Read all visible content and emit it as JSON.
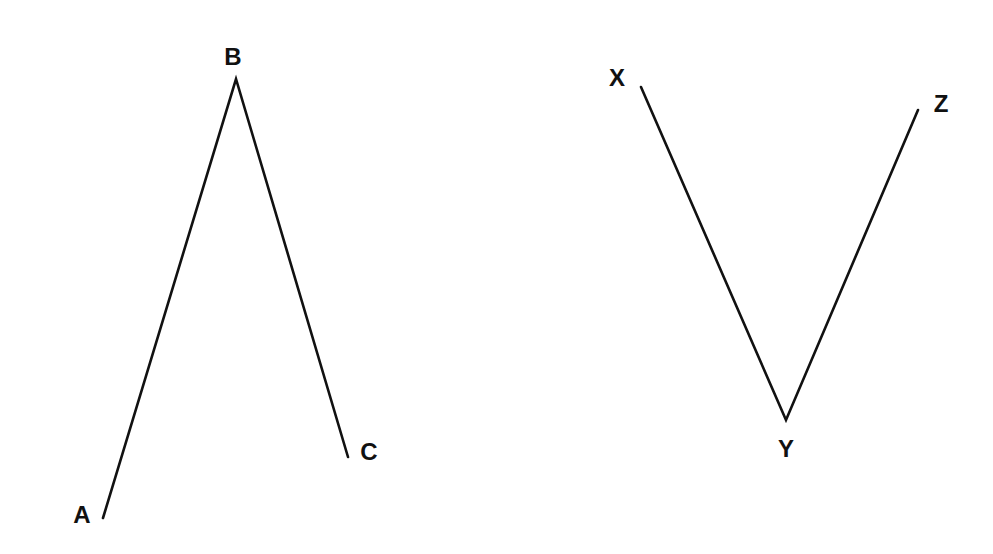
{
  "figures": [
    {
      "name": "angle-ABC",
      "points": [
        {
          "label": "A",
          "x": 103,
          "y": 518,
          "lx": 82,
          "ly": 523
        },
        {
          "label": "B",
          "x": 236,
          "y": 79,
          "lx": 233,
          "ly": 65
        },
        {
          "label": "C",
          "x": 348,
          "y": 457,
          "lx": 369,
          "ly": 460
        }
      ]
    },
    {
      "name": "angle-XYZ",
      "points": [
        {
          "label": "X",
          "x": 641,
          "y": 87,
          "lx": 617,
          "ly": 86
        },
        {
          "label": "Y",
          "x": 786,
          "y": 420,
          "lx": 786,
          "ly": 457
        },
        {
          "label": "Z",
          "x": 918,
          "y": 110,
          "lx": 941,
          "ly": 112
        }
      ]
    }
  ],
  "style": {
    "line_color": "#111111",
    "background": "#ffffff"
  }
}
